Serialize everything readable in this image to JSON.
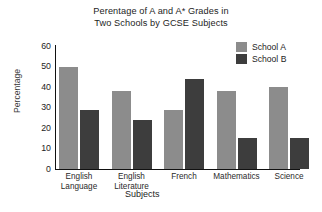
{
  "chart_data": {
    "type": "bar",
    "title": "Perentage of A and A* Grades in Two Schools by GCSE Subjects",
    "title_line1": "Perentage of A and A* Grades in",
    "title_line2": "Two Schools by GCSE Subjects",
    "xlabel": "Subjects",
    "ylabel": "Percentage",
    "categories": [
      "English Language",
      "English Literature",
      "French",
      "Mathematics",
      "Science"
    ],
    "category_lines": [
      [
        "English",
        "Language"
      ],
      [
        "English",
        "Literature"
      ],
      [
        "French",
        ""
      ],
      [
        "Mathematics",
        ""
      ],
      [
        "Science",
        ""
      ]
    ],
    "series": [
      {
        "name": "School A",
        "color": "#8c8c8c",
        "values": [
          50,
          38,
          29,
          38,
          40
        ]
      },
      {
        "name": "School B",
        "color": "#3d3d3d",
        "values": [
          29,
          24,
          44,
          15,
          15
        ]
      }
    ],
    "ylim": [
      0,
      60
    ],
    "yticks": [
      60,
      50,
      40,
      30,
      20,
      10,
      0
    ],
    "ytick_labels": [
      "60",
      "50",
      "40",
      "30",
      "20",
      "10",
      "0"
    ],
    "grid": false,
    "legend_position": "top-right"
  },
  "legend": {
    "entries": [
      {
        "label": "School A",
        "color": "#8c8c8c"
      },
      {
        "label": "School B",
        "color": "#3d3d3d"
      }
    ]
  },
  "axis": {
    "y_label": "Percentage",
    "x_label": "Subjects",
    "y_ticks": [
      "60",
      "50",
      "40",
      "30",
      "20",
      "10",
      "0"
    ]
  }
}
